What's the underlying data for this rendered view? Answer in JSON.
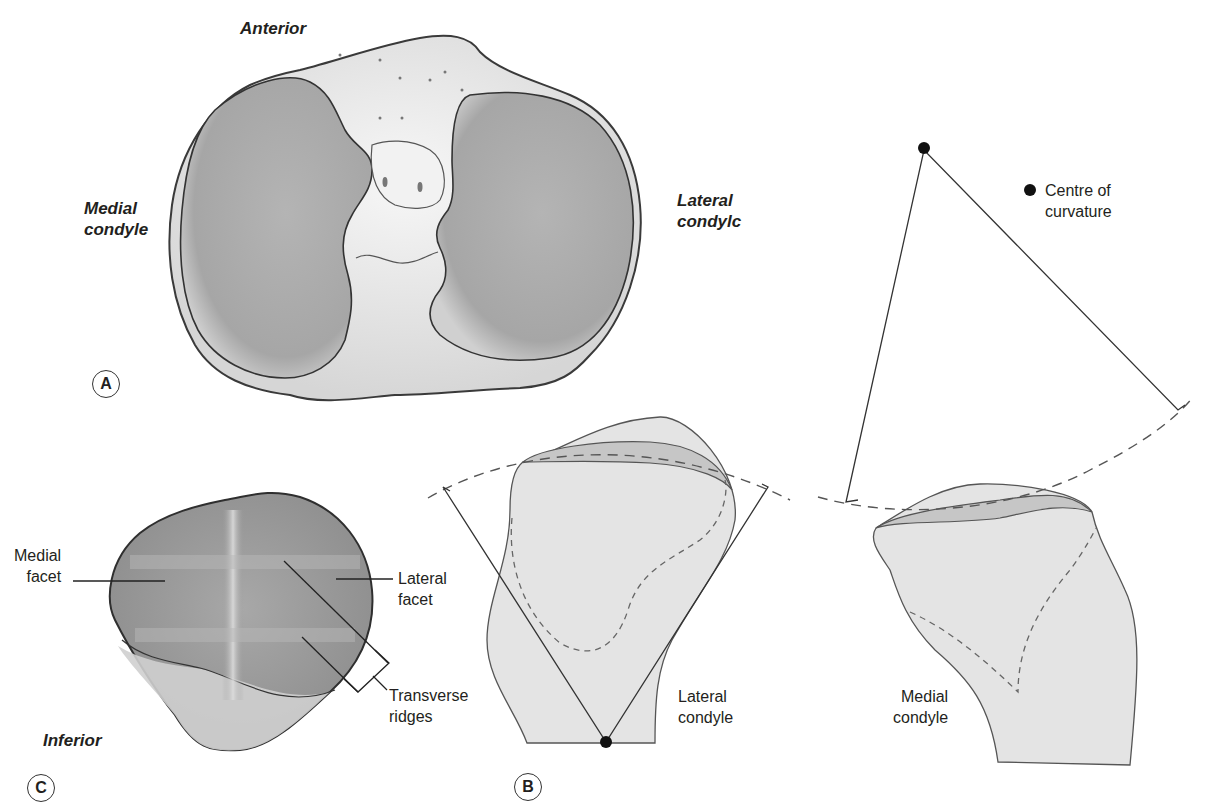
{
  "panel_a": {
    "badge": "A",
    "labels": {
      "anterior": "Anterior",
      "medial_condyle": "Medial\ncondyle",
      "lateral_condyle": "Lateral\ncondylc"
    }
  },
  "panel_b": {
    "badge": "B",
    "legend": {
      "marker": "filled-circle",
      "text": "Centre of\ncurvature"
    },
    "labels": {
      "lateral_condyle": "Lateral\ncondyle",
      "medial_condyle": "Medial\ncondyle"
    }
  },
  "panel_c": {
    "badge": "C",
    "labels": {
      "medial_facet": "Medial\nfacet",
      "lateral_facet": "Lateral\nfacet",
      "transverse_ridges": "Transverse\nridges",
      "inferior": "Inferior"
    }
  },
  "colors": {
    "outline": "#3a3a3a",
    "bone_fill": "#e4e4e4",
    "cartilage_band": "#c8c8c8",
    "condyle_surface": "#a9a9a9",
    "text": "#231f20"
  }
}
